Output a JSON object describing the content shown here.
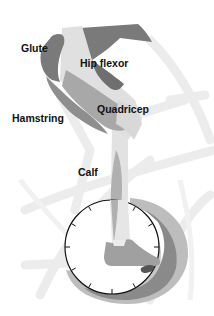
{
  "figure": {
    "labels": {
      "glute": "Glute",
      "hip_flexor": "Hip flexor",
      "quadricep": "Quadricep",
      "hamstring": "Hamstring",
      "calf": "Calf"
    },
    "clock_ticks": 12,
    "colors": {
      "background": "#ffffff",
      "bike_ghost": "#ececec",
      "glute": "#7a7a7a",
      "hip_flexor": "#6a6a6a",
      "quadricep": "#a8a8a8",
      "hamstring": "#8e8e8e",
      "calf": "#b0b0b0",
      "leg_light": "#dcdcdc",
      "shoe": "#a0a0a0",
      "arc_outer": "#bdbdbd",
      "arc_mid": "#8a8a8a",
      "arc_inner": "#c6c6c6",
      "clock_stroke": "#111111",
      "label_text": "#111111"
    }
  }
}
